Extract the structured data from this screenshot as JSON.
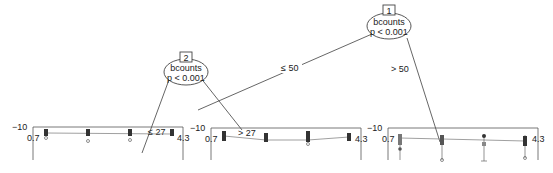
{
  "diagram": {
    "type": "conditional inference tree",
    "nodes": [
      {
        "id": "1",
        "variable": "bcounts",
        "pvalue": "p < 0.001"
      },
      {
        "id": "2",
        "variable": "bcounts",
        "pvalue": "p < 0.001"
      }
    ],
    "edges": [
      {
        "from": "1",
        "to": "2",
        "label": "≤ 50"
      },
      {
        "from": "1",
        "to": "terminal-3",
        "label": "> 50"
      },
      {
        "from": "2",
        "to": "terminal-1",
        "label": "≤ 27"
      },
      {
        "from": "2",
        "to": "terminal-2",
        "label": "> 27"
      }
    ],
    "terminals": [
      {
        "name": "terminal-1",
        "y_top_label": "−10",
        "x_left_label": "0.7",
        "x_right_label": "4.3"
      },
      {
        "name": "terminal-2",
        "y_top_label": "−10",
        "x_left_label": "0.7",
        "x_right_label": "4.3"
      },
      {
        "name": "terminal-3",
        "y_top_label": "−10",
        "x_left_label": "0.7",
        "x_right_label": "4.3"
      }
    ]
  }
}
